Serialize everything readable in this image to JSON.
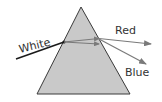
{
  "diagram": {
    "labels": {
      "incoming": "White",
      "ray_top": "Red",
      "ray_bottom": "Blue"
    },
    "colors": {
      "prism_fill": "#c9c9c9",
      "prism_stroke": "#3a3a3a",
      "incoming_ray": "#1a1a1a",
      "dispersed_ray": "#7a7a7a",
      "label": "#333333"
    }
  }
}
